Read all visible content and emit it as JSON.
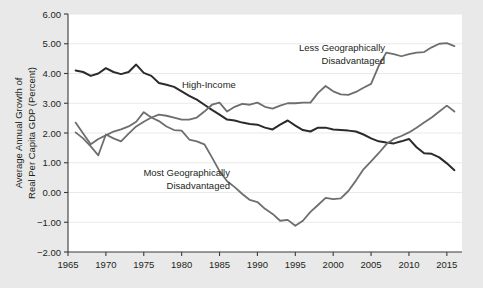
{
  "chart_data": {
    "type": "line",
    "title": "",
    "xlabel": "",
    "ylabel": "Average Annual Growth of Real Per Capita GDP (Percent)",
    "xlim": [
      1965,
      2017
    ],
    "ylim": [
      -2.0,
      6.0
    ],
    "grid": true,
    "legend": "annotations-on-plot",
    "x_ticks": [
      1965,
      1970,
      1975,
      1980,
      1985,
      1990,
      1995,
      2000,
      2005,
      2010,
      2015
    ],
    "x_tick_labels": [
      "1965",
      "1970",
      "1975",
      "1980",
      "1985",
      "1990",
      "1995",
      "2000",
      "2005",
      "2010",
      "2015"
    ],
    "y_ticks": [
      -2.0,
      -1.0,
      0.0,
      1.0,
      2.0,
      3.0,
      4.0,
      5.0,
      6.0
    ],
    "y_tick_labels": [
      "-2.00",
      "-1.00",
      "0.00",
      "1.00",
      "2.00",
      "3.00",
      "4.00",
      "5.00",
      "6.00"
    ],
    "x": [
      1966,
      1967,
      1968,
      1969,
      1970,
      1971,
      1972,
      1973,
      1974,
      1975,
      1976,
      1977,
      1978,
      1979,
      1980,
      1981,
      1982,
      1983,
      1984,
      1985,
      1986,
      1987,
      1988,
      1989,
      1990,
      1991,
      1992,
      1993,
      1994,
      1995,
      1996,
      1997,
      1998,
      1999,
      2000,
      2001,
      2002,
      2003,
      2004,
      2005,
      2006,
      2007,
      2008,
      2009,
      2010,
      2011,
      2012,
      2013,
      2014,
      2015,
      2016
    ],
    "series": [
      {
        "name": "High-Income",
        "color": "#2b2b2b",
        "values": [
          4.1,
          4.05,
          3.92,
          4.0,
          4.18,
          4.05,
          3.98,
          4.05,
          4.3,
          4.02,
          3.92,
          3.68,
          3.62,
          3.55,
          3.4,
          3.25,
          3.12,
          2.95,
          2.78,
          2.62,
          2.45,
          2.42,
          2.35,
          2.3,
          2.28,
          2.18,
          2.12,
          2.28,
          2.42,
          2.25,
          2.1,
          2.05,
          2.18,
          2.18,
          2.12,
          2.1,
          2.08,
          2.05,
          1.95,
          1.82,
          1.72,
          1.68,
          1.65,
          1.72,
          1.8,
          1.52,
          1.32,
          1.3,
          1.18,
          0.98,
          0.75
        ]
      },
      {
        "name": "Less Geographically Disadvantaged",
        "color": "#6e6e6e",
        "values": [
          2.02,
          1.82,
          1.55,
          1.25,
          1.95,
          1.82,
          1.72,
          1.98,
          2.22,
          2.38,
          2.52,
          2.62,
          2.58,
          2.52,
          2.45,
          2.45,
          2.52,
          2.72,
          2.95,
          3.02,
          2.72,
          2.88,
          2.98,
          2.95,
          3.02,
          2.88,
          2.82,
          2.92,
          3.0,
          3.0,
          3.02,
          3.02,
          3.35,
          3.58,
          3.4,
          3.3,
          3.28,
          3.38,
          3.52,
          3.65,
          4.25,
          4.7,
          4.65,
          4.58,
          4.65,
          4.7,
          4.72,
          4.88,
          5.0,
          5.02,
          4.92
        ]
      },
      {
        "name": "Most Geographically Disadvantaged",
        "color": "#6e6e6e",
        "values": [
          2.35,
          1.98,
          1.62,
          1.8,
          1.92,
          2.05,
          2.12,
          2.22,
          2.38,
          2.7,
          2.52,
          2.4,
          2.22,
          2.1,
          2.08,
          1.78,
          1.72,
          1.62,
          1.18,
          0.72,
          0.38,
          0.18,
          -0.05,
          -0.25,
          -0.32,
          -0.55,
          -0.72,
          -0.95,
          -0.92,
          -1.12,
          -0.95,
          -0.65,
          -0.42,
          -0.18,
          -0.22,
          -0.2,
          0.05,
          0.4,
          0.78,
          1.05,
          1.32,
          1.62,
          1.8,
          1.9,
          2.02,
          2.18,
          2.35,
          2.52,
          2.72,
          2.92,
          2.72
        ]
      }
    ],
    "annotations": [
      {
        "id": "less-label",
        "lines": [
          "Less Geographically",
          "Disadvantaged"
        ],
        "align": "right"
      },
      {
        "id": "high-income-label",
        "lines": [
          "High-Income"
        ],
        "align": "left"
      },
      {
        "id": "most-label",
        "lines": [
          "Most Geographically",
          "Disadvantaged"
        ],
        "align": "right"
      }
    ]
  },
  "figure": {
    "background_color": "#e9e9e9",
    "plot_background_color": "#ffffff"
  }
}
